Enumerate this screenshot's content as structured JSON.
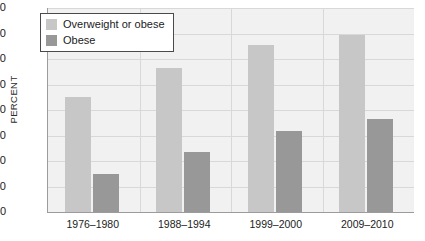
{
  "chart_data": {
    "type": "bar",
    "title": "",
    "xlabel": "",
    "ylabel": "PERCENT",
    "ylim": [
      0,
      80
    ],
    "ytick_step": 10,
    "yticks": [
      "80",
      "70",
      "60",
      "50",
      "40",
      "30",
      "20",
      "10",
      "0"
    ],
    "grid": true,
    "legend_position": "top-left",
    "categories": [
      "1976–1980",
      "1988–1994",
      "1999–2000",
      "2009–2010"
    ],
    "series": [
      {
        "name": "Overweight or obese",
        "color": "#c7c7c7",
        "values": [
          45.0,
          56.5,
          65.5,
          69.5
        ]
      },
      {
        "name": "Obese",
        "color": "#989898",
        "values": [
          15.0,
          23.5,
          31.8,
          36.5
        ]
      }
    ]
  },
  "axes": {
    "y_title": "PERCENT",
    "y_ticks": [
      {
        "label": "80",
        "value": 80
      },
      {
        "label": "70",
        "value": 70
      },
      {
        "label": "60",
        "value": 60
      },
      {
        "label": "50",
        "value": 50
      },
      {
        "label": "40",
        "value": 40
      },
      {
        "label": "30",
        "value": 30
      },
      {
        "label": "20",
        "value": 20
      },
      {
        "label": "10",
        "value": 10
      },
      {
        "label": "0",
        "value": 0
      }
    ],
    "x_ticks": [
      {
        "label": "1976–1980"
      },
      {
        "label": "1988–1994"
      },
      {
        "label": "1999–2000"
      },
      {
        "label": "2009–2010"
      }
    ]
  },
  "legend": {
    "entries": [
      {
        "label": "Overweight or obese",
        "color": "#c7c7c7"
      },
      {
        "label": "Obese",
        "color": "#989898"
      }
    ]
  },
  "colors": {
    "plot_background": "#f1f1f1",
    "page_background": "#ffffff",
    "gridline": "#d8d8d8",
    "axis_line": "#9c9c9c",
    "text": "#1c1c1c",
    "light_bar": "#c7c7c7",
    "dark_bar": "#989898"
  }
}
